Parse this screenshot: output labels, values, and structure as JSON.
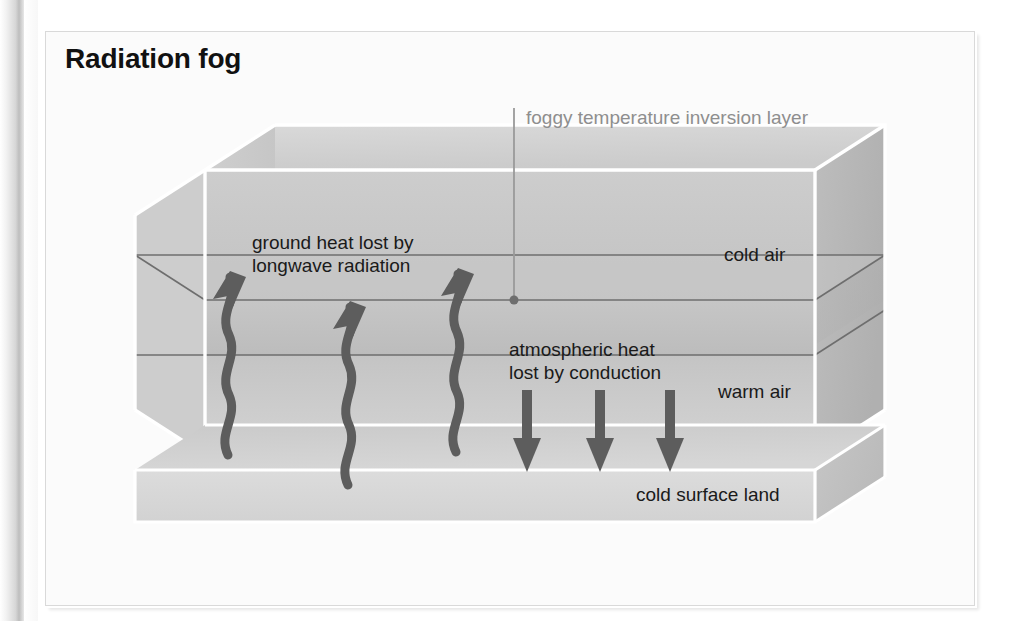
{
  "figure": {
    "title": "Radiation fog",
    "callout": {
      "text": "foggy temperature inversion layer",
      "color": "#8e8e8e",
      "leader_dot_at": [
        514,
        300
      ]
    },
    "labels": {
      "ground_heat_line1": "ground heat lost by",
      "ground_heat_line2": "longwave radiation",
      "atmospheric_line1": "atmospheric heat",
      "atmospheric_line2": "lost by conduction",
      "cold_air": "cold air",
      "warm_air": "warm air",
      "cold_surface_land": "cold surface land"
    },
    "colors": {
      "page": "#ffffff",
      "panel_fill": "#fbfbfb",
      "panel_border": "#d9d9d9",
      "title_text": "#111111",
      "label_text": "#1a1a1a",
      "callout_text": "#8e8e8e",
      "box_top_face": "#d2d2d2",
      "box_front_cold": "#c7c7c7",
      "box_front_warm": "#bfbfbf",
      "box_side_face": "#b4b4b4",
      "land_slab": "#d8d8d8",
      "inversion_line": "#6e6e6e",
      "edge_white": "#ffffff",
      "arrow_dark": "#5a5a5a"
    },
    "arrows": {
      "upward_wavy_label": "ground heat lost by longwave radiation",
      "upward_wavy_count": 3,
      "downward_label": "atmospheric heat lost by conduction",
      "downward_count": 3
    },
    "layers": [
      {
        "name": "cold air",
        "position": "upper"
      },
      {
        "name": "foggy temperature inversion layer",
        "position": "middle"
      },
      {
        "name": "warm air",
        "position": "lower"
      },
      {
        "name": "cold surface land",
        "position": "base slab"
      }
    ]
  }
}
